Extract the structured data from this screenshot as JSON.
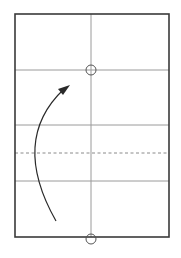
{
  "diagram": {
    "type": "origami-fold-step",
    "title": "",
    "colors": {
      "paper_edge": "#3a3a3a",
      "crease": "#9a9a9a",
      "valley_fold": "#8a8a8a",
      "arrow": "#2a2a2a",
      "reference_marker": "#555555",
      "background": "#ffffff"
    },
    "paper": {
      "x": 15,
      "y": 14,
      "width": 154,
      "height": 223
    },
    "creases": {
      "vertical_center_x": 91,
      "horizontal_y": [
        70,
        125,
        181
      ]
    },
    "valley_fold_line": {
      "y": 153,
      "style": "dashed"
    },
    "reference_markers": [
      {
        "name": "top-circle",
        "cx": 91,
        "cy": 70,
        "r": 5
      },
      {
        "name": "bottom-circle",
        "cx": 91,
        "cy": 239,
        "r": 5
      }
    ],
    "fold_arrow": {
      "direction": "up",
      "start": [
        56,
        221
      ],
      "control": [
        10,
        140
      ],
      "end": [
        69,
        86
      ]
    }
  }
}
